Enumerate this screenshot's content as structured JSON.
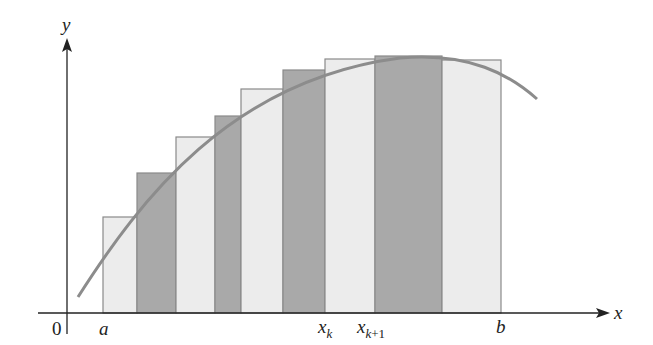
{
  "figure": {
    "axes": {
      "x_label": "x",
      "y_label": "y",
      "origin_label": "0"
    },
    "tick_labels": {
      "a": "a",
      "xk_base": "x",
      "xk_sub": "k",
      "xk1_base": "x",
      "xk1_sub_var": "k",
      "xk1_sub_rest": "+1",
      "b": "b"
    },
    "colors": {
      "light_fill": "#ececec",
      "dark_fill": "#a9a9a9",
      "rect_stroke": "#8a8a8a",
      "curve": "#8c8c8c",
      "axis": "#222222"
    }
  },
  "chart_data": {
    "type": "bar",
    "title": "",
    "xlabel": "x",
    "ylabel": "y",
    "grid": false,
    "legend": null,
    "annotations": [
      "0",
      "a",
      "x_k",
      "x_{k+1}",
      "b"
    ],
    "px_geometry": {
      "x_axis_y": 313,
      "y_axis_x": 67
    },
    "rectangles": [
      {
        "x0": 103,
        "x1": 137,
        "top": 217,
        "shade": "light"
      },
      {
        "x0": 137,
        "x1": 176,
        "top": 173,
        "shade": "dark"
      },
      {
        "x0": 176,
        "x1": 215,
        "top": 137,
        "shade": "light"
      },
      {
        "x0": 215,
        "x1": 241,
        "top": 116,
        "shade": "dark"
      },
      {
        "x0": 241,
        "x1": 283,
        "top": 89,
        "shade": "light"
      },
      {
        "x0": 283,
        "x1": 325,
        "top": 70,
        "shade": "dark"
      },
      {
        "x0": 325,
        "x1": 375,
        "top": 59,
        "shade": "light",
        "left_edge_label": "x_k"
      },
      {
        "x0": 375,
        "x1": 442,
        "top": 56,
        "shade": "dark",
        "left_edge_label": "x_{k+1}"
      },
      {
        "x0": 442,
        "x1": 501,
        "top": 60,
        "shade": "light",
        "right_edge_label": "b"
      }
    ],
    "curve": "concave-down arc rising from near x-axis left of a, peaking near x_{k+1}..x_{k+2}, descending past b"
  }
}
